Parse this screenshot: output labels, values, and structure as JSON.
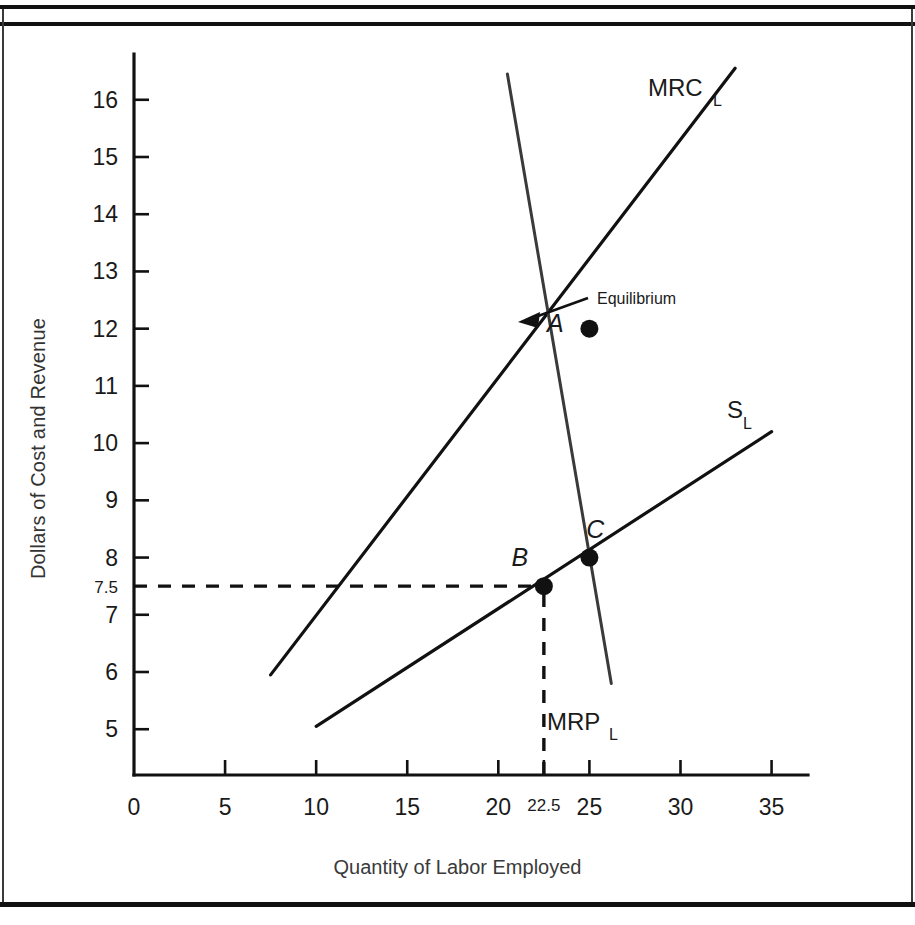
{
  "figure": {
    "frame": "double-rule-top-single-rule-bottom"
  },
  "chart_data": {
    "type": "line",
    "title": "",
    "xlabel": "Quantity of Labor Employed",
    "ylabel": "Dollars of Cost and Revenue",
    "xlim": [
      0,
      37
    ],
    "ylim": [
      4.2,
      16.8
    ],
    "grid": false,
    "legend": "inline curve labels",
    "x_ticks": [
      "0",
      "5",
      "10",
      "15",
      "20",
      "22.5",
      "25",
      "30",
      "35"
    ],
    "x_tick_values": [
      0,
      5,
      10,
      15,
      20,
      22.5,
      25,
      30,
      35
    ],
    "x_minor_emphasis": "22.5",
    "y_ticks": [
      "16",
      "15",
      "14",
      "13",
      "12",
      "11",
      "10",
      "9",
      "8",
      "7.5",
      "7",
      "6",
      "5"
    ],
    "y_tick_values": [
      16,
      15,
      14,
      13,
      12,
      11,
      10,
      9,
      8,
      7.5,
      7,
      6,
      5
    ],
    "y_minor_emphasis": "7.5",
    "series": [
      {
        "name": "MRC_L",
        "label_text": "MRC",
        "label_sub": "L",
        "description": "Marginal Resource Cost of Labor, upward sloping steeper line",
        "points": [
          [
            7.5,
            5.95
          ],
          [
            33.0,
            16.55
          ]
        ]
      },
      {
        "name": "S_L",
        "label_text": "S",
        "label_sub": "L",
        "description": "Labor Supply curve, upward sloping flatter line",
        "points": [
          [
            10.0,
            5.05
          ],
          [
            35.0,
            10.2
          ]
        ]
      },
      {
        "name": "MRP_L",
        "label_text": "MRP",
        "label_sub": "L",
        "description": "Marginal Revenue Product of Labor, downward sloping steep line",
        "points": [
          [
            20.5,
            16.45
          ],
          [
            26.2,
            5.8
          ]
        ]
      }
    ],
    "points_of_interest": [
      {
        "label": "A",
        "x": 25.0,
        "y": 12.0,
        "note": "MRC_L = MRP_L equilibrium employment point"
      },
      {
        "label": "B",
        "x": 22.5,
        "y": 7.5,
        "note": "Monopsony wage on labor supply curve"
      },
      {
        "label": "C",
        "x": 25.0,
        "y": 8.0,
        "note": "Competitive intersection of S_L and MRP_L"
      }
    ],
    "annotations": [
      {
        "text": "Equilibrium",
        "target_label": "A",
        "style": "arrow leader pointing left to point A"
      }
    ],
    "reference_lines": [
      {
        "orientation": "horizontal",
        "value": 7.5,
        "from_x": 0,
        "to_x": 22.5,
        "style": "dashed"
      },
      {
        "orientation": "vertical",
        "value": 22.5,
        "from_y": 4.2,
        "to_y": 7.5,
        "style": "dashed"
      }
    ]
  },
  "axis_titles": {
    "y": "Dollars of Cost and Revenue",
    "x": "Quantity of Labor Employed"
  }
}
